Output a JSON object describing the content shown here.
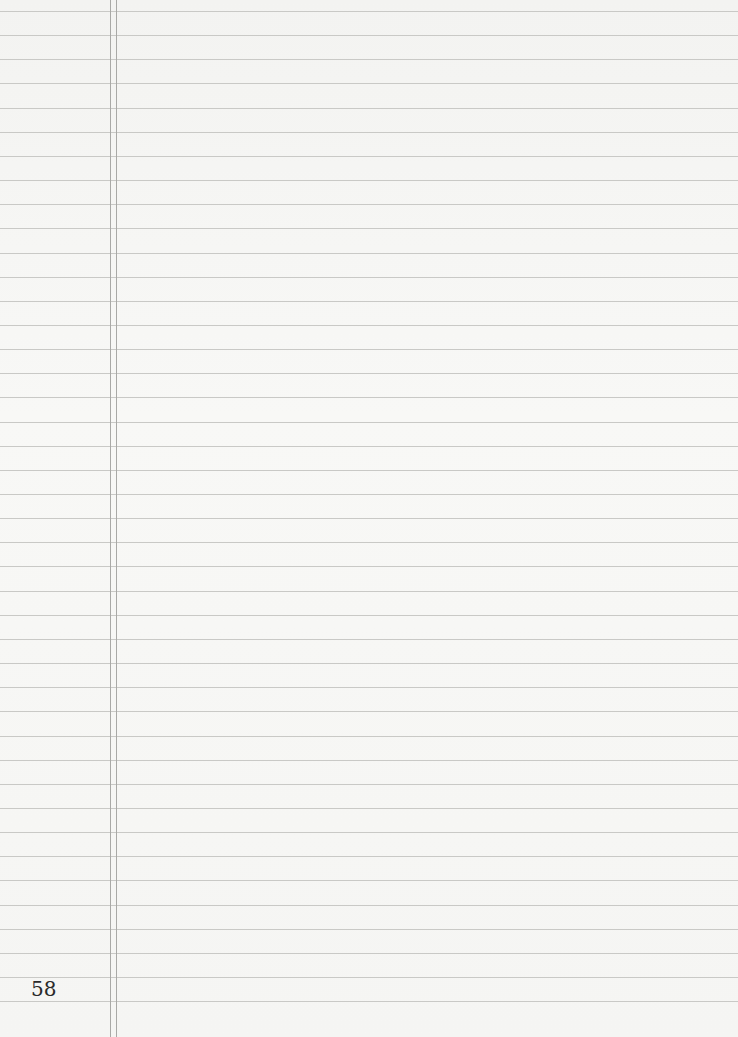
{
  "page": {
    "type": "lined-notebook-page",
    "page_number": "58",
    "line_count": 42,
    "line_spacing_px": 24.15,
    "first_line_y": 11,
    "margin_lines_x": [
      110,
      116
    ],
    "colors": {
      "paper": "#f6f6f4",
      "rule_line": "#c9c9c6",
      "margin_line": "#a9a9a6",
      "text": "#2a2a2a"
    }
  }
}
